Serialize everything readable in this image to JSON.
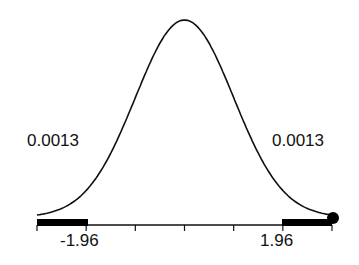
{
  "chart_data": {
    "type": "line",
    "title": "",
    "xlabel": "",
    "ylabel": "",
    "curve": "standard normal density",
    "xlim": [
      -3,
      3
    ],
    "x_ticks": [
      -3,
      -2,
      -1,
      0,
      1,
      2,
      3
    ],
    "tick_labels": [
      "-1.96",
      "1.96"
    ],
    "critical_values": [
      -1.96,
      1.96
    ],
    "tail_probabilities": [
      {
        "side": "left",
        "value": "0.0013",
        "region": [
          -3,
          -1.96
        ]
      },
      {
        "side": "right",
        "value": "0.0013",
        "region": [
          1.96,
          3
        ]
      }
    ],
    "marker": {
      "x": 3,
      "shape": "filled-circle"
    },
    "grid": false,
    "colors": {
      "line": "#111111",
      "fill": "#000000",
      "background": "#ffffff"
    }
  },
  "labels": {
    "left_prob": "0.0013",
    "right_prob": "0.0013",
    "left_crit": "-1.96",
    "right_crit": "1.96"
  }
}
